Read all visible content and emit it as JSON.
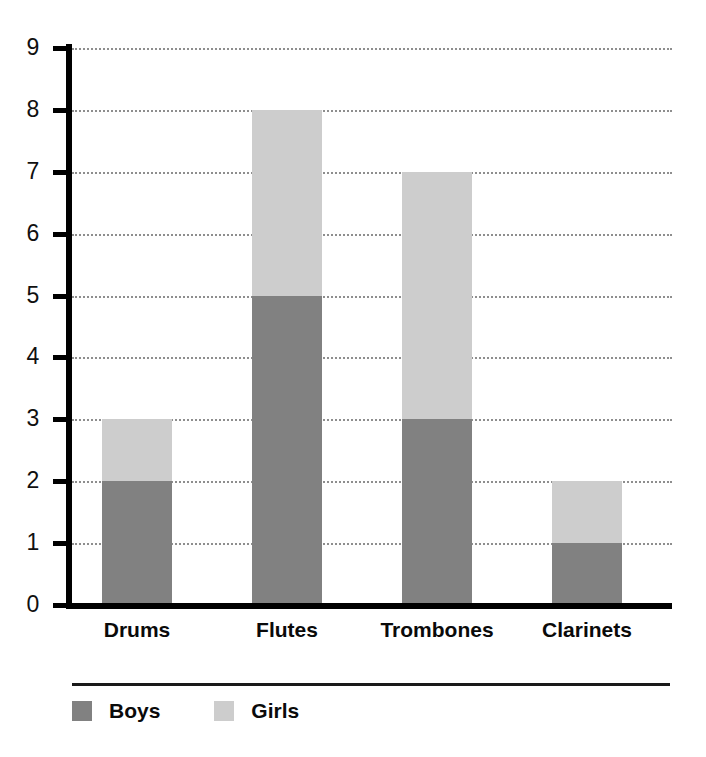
{
  "chart_data": {
    "type": "bar",
    "subtype": "stacked-vertical",
    "title": "",
    "xlabel": "",
    "ylabel": "",
    "categories": [
      "Drums",
      "Flutes",
      "Trombones",
      "Clarinets"
    ],
    "series": [
      {
        "name": "Boys",
        "values": [
          2,
          5,
          3,
          1
        ],
        "color": "#818181"
      },
      {
        "name": "Girls",
        "values": [
          1,
          3,
          4,
          1
        ],
        "color": "#cdcdcd"
      }
    ],
    "totals": [
      3,
      8,
      7,
      2
    ],
    "ylim": [
      0,
      9
    ],
    "ytick_labels": [
      "0",
      "1",
      "2",
      "3",
      "4",
      "5",
      "6",
      "7",
      "8",
      "9"
    ],
    "ytick_values": [
      0,
      1,
      2,
      3,
      4,
      5,
      6,
      7,
      8,
      9
    ],
    "grid": "horizontal-dotted",
    "legend_position": "bottom-left",
    "axis_color": "#000000",
    "gridline_color": "#8e8e8e"
  },
  "legend": {
    "entries": [
      {
        "label": "Boys",
        "color": "#818181"
      },
      {
        "label": "Girls",
        "color": "#cdcdcd"
      }
    ]
  }
}
